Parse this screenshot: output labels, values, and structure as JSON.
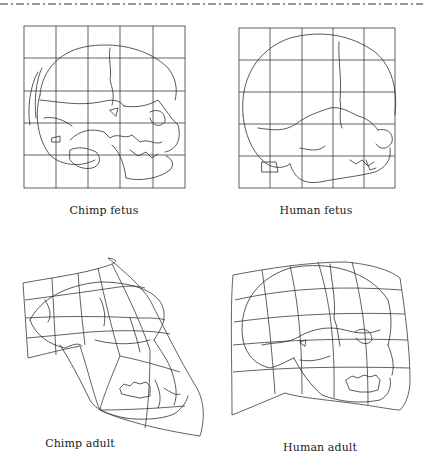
{
  "figure": {
    "rule_style": "dash-dot",
    "line_color": "#333333",
    "background": "#ffffff",
    "panels": [
      {
        "id": "chimp-fetus",
        "label": "Chimp fetus",
        "grid": {
          "cols": 5,
          "rows": 5,
          "style": "rectangular"
        }
      },
      {
        "id": "human-fetus",
        "label": "Human fetus",
        "grid": {
          "cols": 5,
          "rows": 5,
          "style": "rectangular"
        }
      },
      {
        "id": "chimp-adult",
        "label": "Chimp adult",
        "grid": {
          "cols": 5,
          "rows": 5,
          "style": "deformed"
        }
      },
      {
        "id": "human-adult",
        "label": "Human adult",
        "grid": {
          "cols": 5,
          "rows": 5,
          "style": "deformed"
        }
      }
    ]
  }
}
